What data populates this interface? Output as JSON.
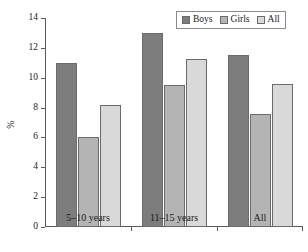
{
  "chart_data": {
    "type": "bar",
    "title": "",
    "xlabel": "",
    "ylabel": "%",
    "categories": [
      "5–10 years",
      "11–15 years",
      "All"
    ],
    "series": [
      {
        "name": "Boys",
        "values": [
          11.0,
          13.0,
          11.5
        ],
        "color": "#7d7d7d"
      },
      {
        "name": "Girls",
        "values": [
          6.0,
          9.5,
          7.55
        ],
        "color": "#b4b4b4"
      },
      {
        "name": "All",
        "values": [
          8.2,
          11.25,
          9.55
        ],
        "color": "#d9d9d9"
      }
    ],
    "ylim": [
      0,
      14
    ],
    "yticks": [
      0,
      2,
      4,
      6,
      8,
      10,
      12,
      14
    ],
    "ytick_labels": [
      "0",
      "2",
      "4",
      "6",
      "8",
      "10",
      "12",
      "14"
    ],
    "grid": false,
    "legend_position": "top-right",
    "legend_entries": [
      "Boys",
      "Girls",
      "All"
    ]
  }
}
